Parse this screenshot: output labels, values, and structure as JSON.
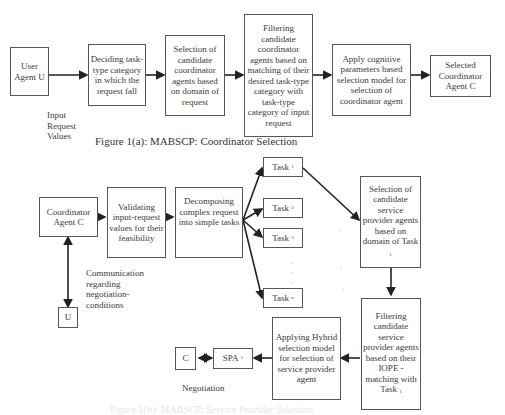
{
  "figure_a": {
    "caption": "Figure 1(a): MABSCP: Coordinator Selection",
    "nodes": {
      "user_agent": "User Agent U",
      "deciding": "Deciding task-type category in which the request fall",
      "selection_coord": "Selection of candidate coordinator agents based on domain of request",
      "filtering_coord": "Filtering candidate coordinator agents based on matching of their desired task-type category with task-type category of input request",
      "apply_cognitive": "Apply cognitive parameters based selection model for selection of coordinator agent",
      "selected_coord": "Selected Coordinator Agent C"
    },
    "input_label": "Input Request Values"
  },
  "figure_b": {
    "caption": "Figure 1(b): MABSCP: Service Provider Selection",
    "nodes": {
      "coordinator": "Coordinator Agent C",
      "validating": "Validating input-request values for their feasibility",
      "decomposing": "Decomposing complex request into simple tasks",
      "task1": "Task",
      "task1_sub": "1",
      "task2": "Task",
      "task2_sub": "2",
      "task3": "Task",
      "task3_sub": "3",
      "taskn": "Task",
      "taskn_sub": "n",
      "selection_sp": "Selection of candidate service provider agents based on domain of Task",
      "selection_sp_sub": "1",
      "filtering_sp": "Filtering candidate service provider agents based on their IOPE -matching with Task",
      "filtering_sp_sub": "1",
      "hybrid": "Applying Hybrid selection model for selection of service provider agent",
      "spa": "SPA",
      "spa_sub": "1",
      "c": "C",
      "u": "U"
    },
    "communication_label": "Communication regarding negotiation-conditions",
    "negotiation_label": "Negotiation"
  }
}
